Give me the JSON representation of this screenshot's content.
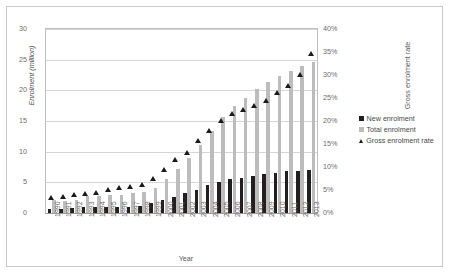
{
  "chart_data": {
    "type": "bar",
    "title": "",
    "xlabel": "Year",
    "ylabel": "Enrolment (million)",
    "ylabel_secondary": "Gross enrolment rate",
    "grid": true,
    "legend_position": "right",
    "ylim": [
      0,
      30
    ],
    "yticks": [
      "0",
      "5",
      "10",
      "15",
      "20",
      "25",
      "30"
    ],
    "ylim_secondary": [
      0,
      40
    ],
    "yticks_secondary": [
      "0%",
      "5%",
      "10%",
      "15%",
      "20%",
      "25%",
      "30%",
      "35%",
      "40%"
    ],
    "categories": [
      "1990",
      "1991",
      "1992",
      "1993",
      "1994",
      "1995",
      "1996",
      "1997",
      "1998",
      "1999",
      "2000",
      "2001",
      "2002",
      "2003",
      "2004",
      "2005",
      "2006",
      "2007",
      "2008",
      "2009",
      "2010",
      "2011",
      "2012",
      "2013"
    ],
    "series": [
      {
        "name": "New enrolment",
        "marker": "dark-square",
        "axis": "left",
        "values": [
          0.6,
          0.6,
          0.75,
          0.9,
          0.9,
          1.0,
          1.0,
          1.0,
          1.1,
          1.6,
          2.2,
          2.6,
          3.2,
          3.8,
          4.5,
          5.0,
          5.5,
          5.7,
          6.1,
          6.4,
          6.6,
          6.8,
          6.9,
          7.0
        ]
      },
      {
        "name": "Total enrolment",
        "marker": "light-square",
        "axis": "left",
        "values": [
          2.1,
          2.0,
          2.2,
          2.8,
          2.8,
          2.9,
          3.0,
          3.2,
          3.4,
          4.1,
          5.6,
          7.2,
          9.0,
          11.1,
          13.3,
          15.6,
          17.4,
          18.8,
          20.2,
          21.4,
          22.3,
          23.1,
          23.9,
          24.6
        ]
      },
      {
        "name": "Gross enrolment rate",
        "marker": "dark-triangle",
        "axis": "right",
        "values": [
          3.4,
          3.5,
          4.0,
          4.2,
          4.5,
          5.1,
          5.4,
          5.7,
          6.1,
          7.5,
          9.5,
          11.5,
          13.2,
          15.7,
          17.8,
          20.0,
          21.6,
          22.5,
          23.4,
          24.5,
          26.2,
          27.6,
          30.1,
          34.6
        ]
      }
    ]
  }
}
